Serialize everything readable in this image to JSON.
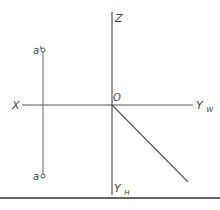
{
  "diagram": {
    "type": "orthographic-projection-axes",
    "colors": {
      "line": "#555555",
      "text": "#444444",
      "background": "#ffffff",
      "rule": "#333333"
    },
    "axes": {
      "z_label": "Z",
      "origin_label": "O",
      "x_label": "X",
      "yw_label": "Y",
      "yw_sub": "W",
      "yh_label": "Y",
      "yh_sub": "H"
    },
    "points": {
      "a_prime_label": "a'",
      "a_label": "a"
    }
  }
}
